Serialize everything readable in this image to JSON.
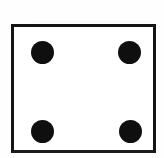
{
  "image": {
    "kind": "dice-face-illustration",
    "title": "Dice face showing four",
    "background_color": "#fefefe",
    "width": 164,
    "height": 158
  },
  "die": {
    "name": "die-face",
    "value": 4,
    "value_label": "4",
    "shape": "square",
    "fill_color": "#ffffff",
    "outline_color": "#141414",
    "outline_width_px": 3,
    "bounds": {
      "x": 11,
      "y": 24,
      "width": 145,
      "height": 129
    }
  },
  "pips": [
    {
      "name": "pip-top-left",
      "position": "top-left",
      "color": "#100f0f",
      "center_x": 42,
      "center_y": 52,
      "diameter": 23
    },
    {
      "name": "pip-top-right",
      "position": "top-right",
      "color": "#100f0f",
      "center_x": 129,
      "center_y": 52,
      "diameter": 23
    },
    {
      "name": "pip-bottom-left",
      "position": "bottom-left",
      "color": "#100f0f",
      "center_x": 42,
      "center_y": 131,
      "diameter": 23
    },
    {
      "name": "pip-bottom-right",
      "position": "bottom-right",
      "color": "#100f0f",
      "center_x": 130,
      "center_y": 131,
      "diameter": 23
    }
  ],
  "accessibility": {
    "alt_text": "A square die face with four black dots, one in each corner"
  }
}
